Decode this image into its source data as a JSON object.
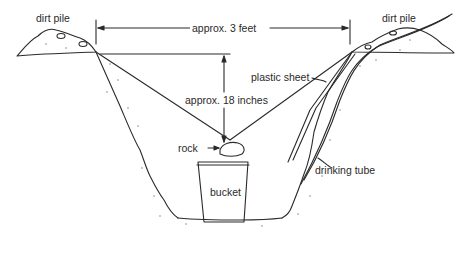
{
  "labels": {
    "dirt_pile_left": "dirt pile",
    "dirt_pile_right": "dirt pile",
    "width_dimension": "approx. 3 feet",
    "depth_dimension": "approx. 18 inches",
    "plastic_sheet": "plastic sheet",
    "rock": "rock",
    "drinking_tube": "drinking tube",
    "bucket": "bucket"
  },
  "colors": {
    "line": "#2a2a2a",
    "stipple": "#888888",
    "background": "#ffffff"
  }
}
